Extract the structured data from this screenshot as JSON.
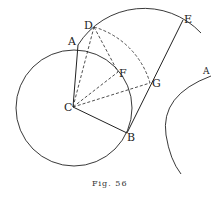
{
  "figure": {
    "caption": "Fig. 56",
    "stroke_color": "#222222",
    "background": "#ffffff"
  },
  "points": {
    "A": {
      "label": "A",
      "x": 78,
      "y": 45
    },
    "B": {
      "label": "B",
      "x": 127,
      "y": 133
    },
    "C": {
      "label": "C",
      "x": 73,
      "y": 107
    },
    "D": {
      "label": "D",
      "x": 94,
      "y": 27
    },
    "E": {
      "label": "E",
      "x": 183,
      "y": 20
    },
    "F": {
      "label": "F",
      "x": 118,
      "y": 72
    },
    "G": {
      "label": "G",
      "x": 150,
      "y": 83
    }
  },
  "right_arc_label": "A",
  "solid_segments": [
    "CA",
    "CB",
    "BE"
  ],
  "dashed_segments": [
    "CD",
    "CF",
    "CG",
    "DF"
  ],
  "circles": [
    {
      "name": "circle-C",
      "center": "C",
      "radius": 58
    },
    {
      "name": "arc-through-A-D-E",
      "center": [
        143,
        87
      ],
      "radius": 78
    },
    {
      "name": "dashed-arc-D-G",
      "center": "C",
      "radius": 82
    }
  ]
}
